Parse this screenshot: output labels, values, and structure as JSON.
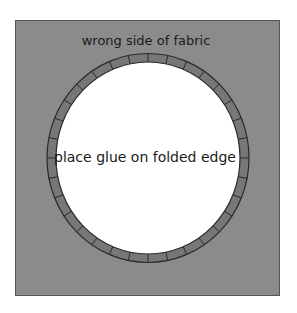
{
  "diagram": {
    "fabric_label": "wrong side of fabric",
    "center_label": "place glue on folded edge",
    "colors": {
      "background": "#ffffff",
      "fabric": "#8b8b8b",
      "fabric_border": "#555555",
      "ring": "#777777",
      "ring_stroke": "#2a2a2a",
      "hole": "#ffffff",
      "text": "#1a1a1a"
    },
    "ring": {
      "tick_count": 32
    }
  }
}
